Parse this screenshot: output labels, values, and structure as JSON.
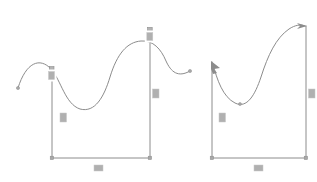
{
  "canvas": {
    "width": 317,
    "height": 182,
    "background": "#ffffff",
    "stroke_color": "#8c8c8c",
    "label_color": "#b0b0b0",
    "title": "sketch-canvas"
  },
  "shapes": [
    {
      "id": "left-shape",
      "name": "s-curve-profile-left",
      "curve_top": "M 18,88 C 26,62 42,58 52,70 C 62,82 66,104 80,108 C 94,112 104,96 110,76 C 116,56 126,44 140,42 C 152,40 160,48 164,62 C 168,76 170,82 172,88",
      "left_rail": {
        "x": 52,
        "y_top": 70,
        "y_bottom": 158
      },
      "right_rail": {
        "x": 150,
        "y_top": 30,
        "y_bottom": 158
      },
      "bottom_rail": {
        "x_start": 52,
        "x_end": 150,
        "y": 158
      },
      "handles": [
        {
          "type": "square",
          "x": 52,
          "y": 70
        },
        {
          "type": "square",
          "x": 150,
          "y": 30
        },
        {
          "type": "dot",
          "x": 18,
          "y": 88
        },
        {
          "type": "dot",
          "x": 190,
          "y": 71
        },
        {
          "type": "dot",
          "x": 52,
          "y": 158
        },
        {
          "type": "dot",
          "x": 150,
          "y": 158
        }
      ],
      "labels": [
        {
          "name": "dimension-label-left-vertical",
          "x": 60,
          "y": 113,
          "w": 7,
          "h": 9
        },
        {
          "name": "dimension-label-right-vertical",
          "x": 152,
          "y": 89,
          "w": 7,
          "h": 9
        },
        {
          "name": "dimension-label-bottom",
          "x": 94,
          "y": 165,
          "w": 9,
          "h": 6
        },
        {
          "name": "dimension-label-left-node",
          "x": 47,
          "y": 70,
          "w": 9,
          "h": 11
        },
        {
          "name": "dimension-label-right-node",
          "x": 146,
          "y": 30,
          "w": 9,
          "h": 11
        }
      ]
    },
    {
      "id": "right-shape",
      "name": "s-curve-profile-right",
      "curve_top": "M 212,62 C 216,78 222,96 234,102 C 246,108 254,96 260,78 C 266,58 274,38 288,28 C 294,24 300,24 304,26",
      "left_rail": {
        "x": 212,
        "y_top": 62,
        "y_bottom": 158
      },
      "right_rail": {
        "x": 306,
        "y_top": 26,
        "y_bottom": 158
      },
      "bottom_rail": {
        "x_start": 212,
        "x_end": 306,
        "y": 158
      },
      "handles": [
        {
          "type": "arrow-down-right",
          "x": 212,
          "y": 62
        },
        {
          "type": "arrow-right",
          "x": 306,
          "y": 26
        },
        {
          "type": "dot",
          "x": 212,
          "y": 158
        },
        {
          "type": "dot",
          "x": 306,
          "y": 158
        },
        {
          "type": "dot",
          "x": 240,
          "y": 103
        }
      ],
      "labels": [
        {
          "name": "dimension-label-left-vertical",
          "x": 219,
          "y": 113,
          "w": 7,
          "h": 9
        },
        {
          "name": "dimension-label-right-vertical",
          "x": 308,
          "y": 89,
          "w": 7,
          "h": 9
        },
        {
          "name": "dimension-label-bottom",
          "x": 254,
          "y": 165,
          "w": 9,
          "h": 6
        }
      ]
    }
  ]
}
